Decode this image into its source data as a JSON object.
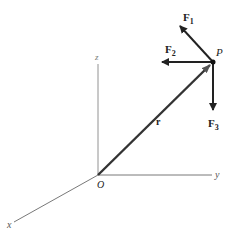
{
  "diagram": {
    "type": "3D force vector diagram",
    "axes": {
      "x": "x",
      "y": "y",
      "z": "z"
    },
    "origin_label": "O",
    "point_label": "P",
    "position_vector_label": "r",
    "forces": [
      {
        "name": "F",
        "sub": "1"
      },
      {
        "name": "F",
        "sub": "2"
      },
      {
        "name": "F",
        "sub": "3"
      }
    ],
    "colors": {
      "axis": "#555555",
      "vector": "#222222",
      "arrow_r": "#333333"
    }
  }
}
